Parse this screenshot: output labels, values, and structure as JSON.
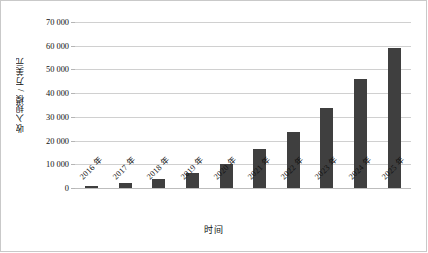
{
  "chart_data": {
    "type": "bar",
    "title": "",
    "xlabel": "时间",
    "ylabel": "收入规模 / 万美元",
    "categories": [
      "2016 年",
      "2017 年",
      "2018 年",
      "2019 年",
      "2020 年",
      "2021 年",
      "2022 年",
      "2023 年",
      "2024 年",
      "2025 年"
    ],
    "values": [
      1000,
      2200,
      3600,
      6300,
      10300,
      16300,
      23700,
      33600,
      45900,
      59000
    ],
    "ylim": [
      0,
      70000
    ],
    "ytick_values": [
      0,
      10000,
      20000,
      30000,
      40000,
      50000,
      60000,
      70000
    ],
    "ytick_labels": [
      "0",
      "10 000",
      "20 000",
      "30 000",
      "40 000",
      "50 000",
      "60 000",
      "70 000"
    ],
    "grid": true,
    "legend": false,
    "series": [
      {
        "name": "收入规模",
        "values": [
          1000,
          2200,
          3600,
          6300,
          10300,
          16300,
          23700,
          33600,
          45900,
          59000
        ]
      }
    ]
  },
  "style": {
    "bar_color": "#3f3f3f",
    "grid_color": "#d0d0d0",
    "axis_color": "#bdbdbd",
    "background": "#ffffff",
    "text_color": "#111111"
  }
}
